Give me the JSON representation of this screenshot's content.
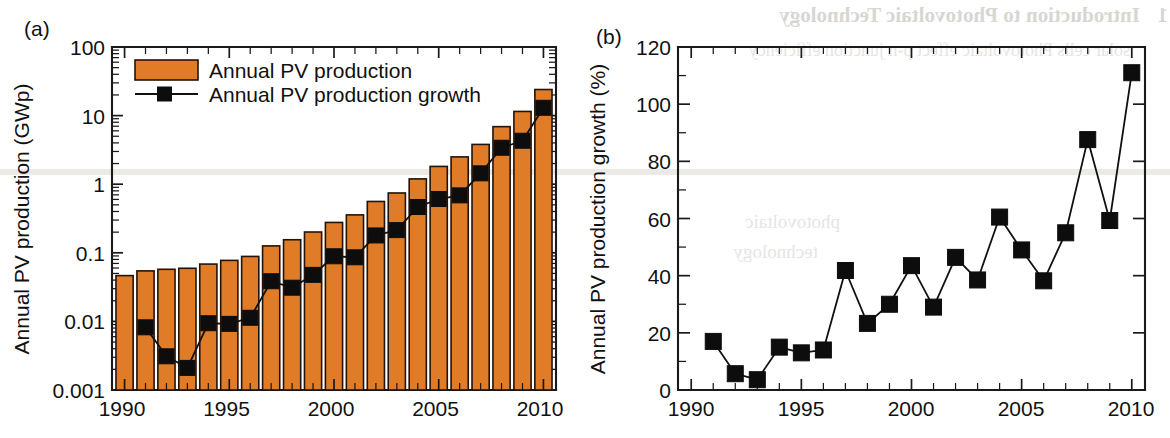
{
  "figure": {
    "background_color": "#ffffff",
    "bar_color": "#E07C28",
    "bar_edge_color": "#231309",
    "line_color": "#111111",
    "marker_color": "#0d0d0d"
  },
  "panel_a": {
    "letter": "(a)",
    "ylabel": "Annual PV production (GWp)",
    "xlabel": "",
    "ytick_labels": [
      "100",
      "10",
      "1",
      "0.1",
      "0.01",
      "0.001"
    ],
    "xtick_labels": [
      "1990",
      "1995",
      "2000",
      "2005",
      "2010"
    ],
    "legend": [
      {
        "label": "Annual PV production",
        "marker": "filled-rectangle-swatch",
        "color": "#E07C28"
      },
      {
        "label": "Annual PV production growth",
        "marker": "line-with-square-marker",
        "color": "#111111"
      }
    ]
  },
  "panel_b": {
    "letter": "(b)",
    "ylabel": "Annual PV production growth (%)",
    "xlabel": "",
    "ytick_labels": [
      "0",
      "20",
      "40",
      "60",
      "80",
      "100",
      "120"
    ],
    "xtick_labels": [
      "1990",
      "1995",
      "2000",
      "2005",
      "2010"
    ]
  },
  "showthrough": {
    "heading": "Introduction to Photovoltaic Technology",
    "heading_number": "1",
    "line2": "solar cells  Photovoltaic  effect  p-n junction  efficiency",
    "word1": "photovoltaic",
    "word2": "technology"
  },
  "chart_data": [
    {
      "type": "bar",
      "panel": "(a)",
      "title": "",
      "xlabel": "",
      "ylabel": "Annual PV production (GWp)",
      "yscale": "log",
      "ylim": [
        0.001,
        100
      ],
      "xlim": [
        1989.4,
        2010.6
      ],
      "grid": false,
      "legend_position": "upper-left",
      "categories": [
        1990,
        1991,
        1992,
        1993,
        1994,
        1995,
        1996,
        1997,
        1998,
        1999,
        2000,
        2001,
        2002,
        2003,
        2004,
        2005,
        2006,
        2007,
        2008,
        2009,
        2010
      ],
      "series": [
        {
          "name": "Annual PV production",
          "type": "bar",
          "units": "GWp",
          "values": [
            0.0465,
            0.0545,
            0.0575,
            0.0595,
            0.0685,
            0.0775,
            0.0885,
            0.126,
            0.155,
            0.201,
            0.277,
            0.357,
            0.56,
            0.745,
            1.195,
            1.815,
            2.5,
            3.8,
            6.9,
            11.5,
            24.0
          ]
        },
        {
          "name": "Annual PV production growth",
          "type": "line-marker",
          "units": "GWp (secondary reading of growth overlay)",
          "note": "overlay markers drawn on the same log axis",
          "values": [
            null,
            0.0082,
            0.0031,
            0.0021,
            0.0094,
            0.0092,
            0.0113,
            0.0385,
            0.031,
            0.0477,
            0.089,
            0.086,
            0.179,
            0.214,
            0.465,
            0.608,
            0.687,
            1.44,
            3.4,
            4.3,
            13.0
          ]
        }
      ]
    },
    {
      "type": "line",
      "panel": "(b)",
      "title": "",
      "xlabel": "",
      "ylabel": "Annual PV production growth (%)",
      "yscale": "linear",
      "ylim": [
        0,
        120
      ],
      "yticks": [
        0,
        20,
        40,
        60,
        80,
        100,
        120
      ],
      "xlim": [
        1989.4,
        2010.6
      ],
      "xticks": [
        1990,
        1995,
        2000,
        2005,
        2010
      ],
      "grid": false,
      "legend_position": "none",
      "x": [
        1991,
        1992,
        1993,
        1994,
        1995,
        1996,
        1997,
        1998,
        1999,
        2000,
        2001,
        2002,
        2003,
        2004,
        2005,
        2006,
        2007,
        2008,
        2009,
        2010
      ],
      "series": [
        {
          "name": "Annual PV production growth",
          "marker": "filled-square",
          "values": [
            17.0,
            5.7,
            3.6,
            15.0,
            13.0,
            14.0,
            41.8,
            23.3,
            30.0,
            43.5,
            29.0,
            46.4,
            38.5,
            60.5,
            49.0,
            38.2,
            55.0,
            87.6,
            59.3,
            111.0
          ]
        }
      ]
    }
  ]
}
